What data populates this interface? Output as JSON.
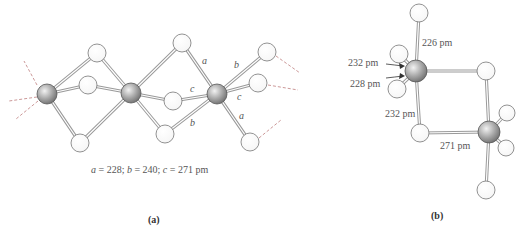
{
  "figure": {
    "panel_a": {
      "caption": "(a)",
      "bond_labels": {
        "a": "a",
        "b": "b",
        "c": "c"
      },
      "legend": {
        "a_label": "a",
        "a_value": " = 228; ",
        "b_label": "b",
        "b_value": " = 240; ",
        "c_label": "c",
        "c_value": " = 271 pm"
      }
    },
    "panel_b": {
      "caption": "(b)",
      "distances": {
        "terminal_top": "226 pm",
        "terminal_upper": "232 pm",
        "terminal_lower": "228 pm",
        "bridge_vertical": "232 pm",
        "bridge_horizontal": "271 pm"
      }
    },
    "colors": {
      "metal_atom": "#8c8c8c",
      "ligand_atom": "#ffffff",
      "bond": "#999999",
      "dashed_bond": "#c08080"
    }
  }
}
